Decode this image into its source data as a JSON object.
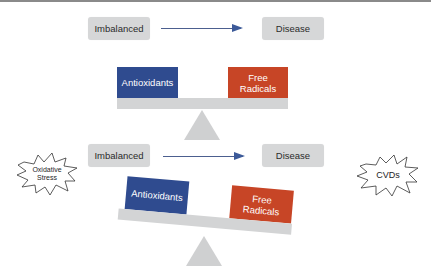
{
  "diagram": {
    "panels": [
      {
        "id": "balanced",
        "flow": {
          "from": "Imbalanced",
          "to": "Disease"
        },
        "scale": {
          "left_label": "Antioxidants",
          "right_label_line1": "Free",
          "right_label_line2": "Radicals",
          "tilt": "level"
        }
      },
      {
        "id": "imbalanced",
        "flow": {
          "from": "Imbalanced",
          "to": "Disease"
        },
        "scale": {
          "left_label": "Antioxidants",
          "right_label_line1": "Free",
          "right_label_line2": "Radicals",
          "tilt": "right-heavy"
        },
        "left_callout": {
          "line1": "Oxidative",
          "line2": "Stress"
        },
        "right_callout": {
          "label": "CVDs"
        }
      }
    ]
  },
  "colors": {
    "antioxidants": "#2f4b8f",
    "free_radicals": "#c74526",
    "pill": "#d6d7d8",
    "beam": "#d3d4d5",
    "arrow": "#3c5a99"
  }
}
